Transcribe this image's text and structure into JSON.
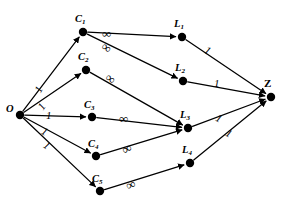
{
  "figure": {
    "kind": "directed-network-flow-graph",
    "background_color": "#ffffff",
    "ink_color": "#000000"
  },
  "nodes": [
    {
      "id": "O",
      "label": "O",
      "sub": "",
      "x": 20,
      "y": 115,
      "label_x": 6,
      "label_y": 104,
      "style": "source"
    },
    {
      "id": "C1",
      "label": "C",
      "sub": "1",
      "x": 83,
      "y": 32,
      "label_x": 75,
      "label_y": 14,
      "style": "italic"
    },
    {
      "id": "C2",
      "label": "C",
      "sub": "2",
      "x": 86,
      "y": 70,
      "label_x": 78,
      "label_y": 52,
      "style": "italic"
    },
    {
      "id": "C3",
      "label": "C",
      "sub": "3",
      "x": 92,
      "y": 117,
      "label_x": 84,
      "label_y": 100,
      "style": "italic"
    },
    {
      "id": "C4",
      "label": "C",
      "sub": "4",
      "x": 96,
      "y": 156,
      "label_x": 88,
      "label_y": 139,
      "style": "italic"
    },
    {
      "id": "C5",
      "label": "C",
      "sub": "5",
      "x": 100,
      "y": 191,
      "label_x": 92,
      "label_y": 174,
      "style": "italic"
    },
    {
      "id": "L1",
      "label": "L",
      "sub": "1",
      "x": 182,
      "y": 37,
      "label_x": 174,
      "label_y": 19,
      "style": "italic"
    },
    {
      "id": "L2",
      "label": "L",
      "sub": "2",
      "x": 183,
      "y": 81,
      "label_x": 175,
      "label_y": 63,
      "style": "italic"
    },
    {
      "id": "L3",
      "label": "L",
      "sub": "3",
      "x": 188,
      "y": 128,
      "label_x": 180,
      "label_y": 110,
      "style": "italic"
    },
    {
      "id": "L4",
      "label": "L",
      "sub": "4",
      "x": 190,
      "y": 163,
      "label_x": 182,
      "label_y": 145,
      "style": "italic"
    },
    {
      "id": "Z",
      "label": "Z",
      "sub": "",
      "x": 271,
      "y": 97,
      "label_x": 264,
      "label_y": 78,
      "style": "sink"
    }
  ],
  "edges": [
    {
      "from": "O",
      "to": "C1",
      "capacity": "1",
      "label_x": 36,
      "label_y": 84,
      "label_kind": "one",
      "label_rot": -62
    },
    {
      "from": "O",
      "to": "C2",
      "capacity": "1",
      "label_x": 39,
      "label_y": 101,
      "label_kind": "one",
      "label_rot": -55
    },
    {
      "from": "O",
      "to": "C3",
      "capacity": "1",
      "label_x": 46,
      "label_y": 110,
      "label_kind": "one",
      "label_rot": 0
    },
    {
      "from": "O",
      "to": "C4",
      "capacity": "1",
      "label_x": 42,
      "label_y": 126,
      "label_kind": "one",
      "label_rot": 30
    },
    {
      "from": "O",
      "to": "C5",
      "capacity": "1",
      "label_x": 44,
      "label_y": 140,
      "label_kind": "one",
      "label_rot": 35
    },
    {
      "from": "C1",
      "to": "L1",
      "capacity": "∞",
      "label_x": 102,
      "label_y": 27,
      "label_kind": "inf",
      "label_rot": 0
    },
    {
      "from": "C1",
      "to": "L2",
      "capacity": "∞",
      "label_x": 102,
      "label_y": 41,
      "label_kind": "inf",
      "label_rot": 35
    },
    {
      "from": "C2",
      "to": "L3",
      "capacity": "∞",
      "label_x": 106,
      "label_y": 72,
      "label_kind": "inf",
      "label_rot": 35
    },
    {
      "from": "C3",
      "to": "L3",
      "capacity": "∞",
      "label_x": 119,
      "label_y": 112,
      "label_kind": "inf",
      "label_rot": 0
    },
    {
      "from": "C4",
      "to": "L3",
      "capacity": "∞",
      "label_x": 122,
      "label_y": 142,
      "label_kind": "inf",
      "label_rot": -28
    },
    {
      "from": "C5",
      "to": "L4",
      "capacity": "∞",
      "label_x": 126,
      "label_y": 178,
      "label_kind": "inf",
      "label_rot": -22
    },
    {
      "from": "L1",
      "to": "Z",
      "capacity": "1",
      "label_x": 205,
      "label_y": 45,
      "label_kind": "one",
      "label_rot": 30
    },
    {
      "from": "L2",
      "to": "Z",
      "capacity": "1",
      "label_x": 214,
      "label_y": 78,
      "label_kind": "one",
      "label_rot": 0
    },
    {
      "from": "L3",
      "to": "Z",
      "capacity": "1",
      "label_x": 216,
      "label_y": 113,
      "label_kind": "one",
      "label_rot": 28
    },
    {
      "from": "L4",
      "to": "Z",
      "capacity": "1",
      "label_x": 226,
      "label_y": 128,
      "label_kind": "one",
      "label_rot": 28
    }
  ]
}
